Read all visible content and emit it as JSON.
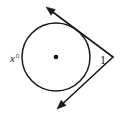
{
  "figure": {
    "type": "geometry-diagram",
    "background_color": "#ffffff",
    "stroke_color": "#1a1a1a",
    "circle": {
      "center_x": 56,
      "center_y": 57,
      "radius": 34,
      "center_dot_radius": 2.3,
      "stroke_width": 1.5
    },
    "labels": {
      "arc_label": "x°",
      "arc_label_x": 10,
      "arc_label_y": 62,
      "angle_label": "1",
      "angle_label_x": 100,
      "angle_label_y": 64
    },
    "vertex": {
      "x": 113,
      "y": 57
    },
    "tangent_upper": {
      "name": "upper-tangent-ray",
      "touch_x": 81.5,
      "touch_y": 35.5,
      "tip_x": 46,
      "tip_y": 7
    },
    "tangent_lower": {
      "name": "lower-tangent-ray",
      "touch_x": 81.5,
      "touch_y": 78.5,
      "tip_x": 57,
      "tip_y": 109
    }
  }
}
